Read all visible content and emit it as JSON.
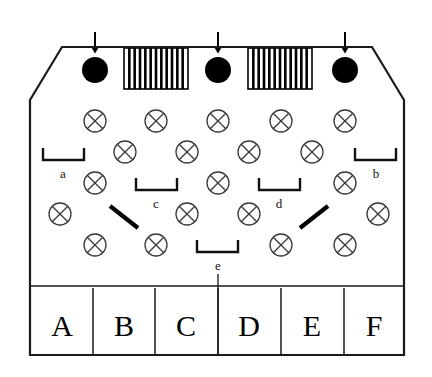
{
  "diagram": {
    "colors": {
      "outline": "#1a1a1a",
      "circle_stroke": "#3a3a3a",
      "filled_dot": "#000000",
      "hatch": "#000000",
      "bracket": "#111111",
      "letter": "#000000",
      "background": "#ffffff"
    },
    "container": {
      "left": 30,
      "right": 404,
      "top_flat": 100,
      "bottom": 355,
      "chamfer_x_left": 62,
      "chamfer_x_right": 372,
      "shoulder_top": 47
    },
    "top_inlets": {
      "arrow_label": "down-arrow",
      "dots": [
        {
          "id": "dot-1",
          "cx": 95,
          "cy": 70,
          "r": 13
        },
        {
          "id": "dot-2",
          "cx": 218,
          "cy": 70,
          "r": 13
        },
        {
          "id": "dot-3",
          "cx": 345,
          "cy": 70,
          "r": 13
        }
      ],
      "arrows": [
        {
          "id": "arrow-1",
          "x": 95,
          "y_top": 32,
          "y_bottom": 52
        },
        {
          "id": "arrow-2",
          "x": 218,
          "y_top": 32,
          "y_bottom": 52
        },
        {
          "id": "arrow-3",
          "x": 345,
          "y_top": 32,
          "y_bottom": 52
        }
      ],
      "hatched_blocks": [
        {
          "id": "hatch-block-1",
          "x": 124,
          "y": 48,
          "width": 64,
          "height": 41,
          "stripes": 11
        },
        {
          "id": "hatch-block-2",
          "x": 248,
          "y": 48,
          "width": 64,
          "height": 41,
          "stripes": 11
        }
      ]
    },
    "crossed_circles": {
      "radius": 11,
      "rows": [
        {
          "row": 1,
          "cy": 121,
          "cx": [
            95,
            156,
            218,
            281,
            345
          ]
        },
        {
          "row": 2,
          "cy": 152,
          "cx": [
            125,
            187,
            249,
            312
          ]
        },
        {
          "row": 3,
          "cy": 183,
          "cx": [
            95,
            218,
            345
          ]
        },
        {
          "row": 4,
          "cy": 214,
          "cx": [
            60,
            187,
            249,
            378
          ]
        },
        {
          "row": 5,
          "cy": 245,
          "cx": [
            95,
            156,
            281,
            345
          ]
        }
      ]
    },
    "diagonal_bars": [
      {
        "id": "bar-left",
        "x1": 110,
        "y1": 206,
        "x2": 138,
        "y2": 228
      },
      {
        "id": "bar-right",
        "x1": 300,
        "y1": 228,
        "x2": 328,
        "y2": 206
      }
    ],
    "brackets": [
      {
        "id": "bracket-a",
        "label": "a",
        "x1": 43,
        "x2": 84,
        "y": 160,
        "tick": 12,
        "label_x": 63,
        "label_y": 178
      },
      {
        "id": "bracket-b",
        "label": "b",
        "x1": 355,
        "x2": 396,
        "y": 160,
        "tick": 12,
        "label_x": 376,
        "label_y": 178
      },
      {
        "id": "bracket-c",
        "label": "c",
        "x1": 136,
        "x2": 177,
        "y": 190,
        "tick": 12,
        "label_x": 156,
        "label_y": 208
      },
      {
        "id": "bracket-d",
        "label": "d",
        "x1": 259,
        "x2": 300,
        "y": 190,
        "tick": 12,
        "label_x": 279,
        "label_y": 208
      },
      {
        "id": "bracket-e",
        "label": "e",
        "x1": 197,
        "x2": 238,
        "y": 252,
        "tick": 12,
        "label_x": 218,
        "label_y": 270
      }
    ],
    "bracket_e_drop_line": {
      "x": 218,
      "y1": 274,
      "y2": 355
    },
    "bottom_band": {
      "top": 286,
      "bottom": 355,
      "letter_baseline": 336,
      "dividers": [
        93,
        155,
        218,
        281,
        344
      ],
      "divider_top": 288,
      "columns": [
        {
          "id": "col-A",
          "label": "A",
          "cx": 62
        },
        {
          "id": "col-B",
          "label": "B",
          "cx": 124
        },
        {
          "id": "col-C",
          "label": "C",
          "cx": 186
        },
        {
          "id": "col-D",
          "label": "D",
          "cx": 249
        },
        {
          "id": "col-E",
          "label": "E",
          "cx": 312
        },
        {
          "id": "col-F",
          "label": "F",
          "cx": 374
        }
      ]
    }
  }
}
